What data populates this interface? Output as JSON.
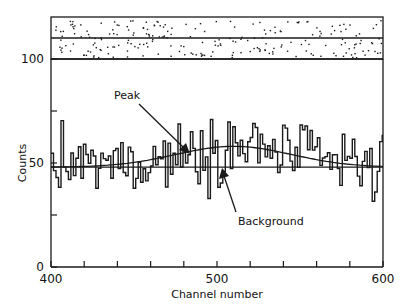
{
  "chart_data": {
    "type": "line",
    "subtype": "histogram-step-with-fitted-curves",
    "title": "",
    "xlabel": "Channel number",
    "ylabel": "Counts",
    "xlim": [
      400,
      600
    ],
    "ylim": [
      0,
      100
    ],
    "x_ticks": [
      400,
      420,
      440,
      460,
      480,
      500,
      520,
      540,
      560,
      580,
      600
    ],
    "x_tick_labels": [
      "400",
      "500",
      "600"
    ],
    "y_ticks": [
      0,
      25,
      50,
      75,
      100
    ],
    "y_tick_labels": [
      "0",
      "50",
      "100"
    ],
    "grid": false,
    "background_level": 48,
    "peak": {
      "center": 510,
      "amplitude": 10,
      "sigma": 35
    },
    "annotations": [
      {
        "text": "Peak",
        "x": 438,
        "y": 82,
        "arrow_to": [
          468,
          57
        ]
      },
      {
        "text": "Background",
        "x": 518,
        "y": 22,
        "arrow_to": [
          508,
          46
        ]
      }
    ],
    "top_panel": {
      "description": "Residual scatter strip above y=100, split by a horizontal center line",
      "rows": 2
    },
    "series": [
      {
        "name": "Counts (histogram)",
        "x": [
          400,
          405,
          410,
          415,
          420,
          425,
          430,
          435,
          440,
          445,
          450,
          455,
          460,
          465,
          470,
          475,
          480,
          485,
          490,
          495,
          500,
          505,
          510,
          515,
          520,
          525,
          530,
          535,
          540,
          545,
          550,
          555,
          560,
          565,
          570,
          575,
          580,
          585,
          590,
          595
        ],
        "values": [
          45,
          52,
          40,
          60,
          38,
          55,
          49,
          42,
          61,
          44,
          53,
          47,
          58,
          43,
          50,
          62,
          46,
          57,
          65,
          55,
          60,
          68,
          52,
          73,
          56,
          60,
          54,
          49,
          52,
          60,
          46,
          55,
          51,
          58,
          44,
          57,
          50,
          53,
          47,
          52
        ]
      },
      {
        "name": "Background",
        "x": [
          400,
          600
        ],
        "values": [
          48,
          48
        ]
      },
      {
        "name": "Peak fit",
        "x": [
          400,
          450,
          480,
          500,
          510,
          520,
          540,
          570,
          600
        ],
        "values": [
          48.1,
          49.6,
          54.5,
          57.6,
          58.0,
          57.6,
          54.5,
          49.6,
          48.1
        ]
      }
    ]
  },
  "axes": {
    "xlabel": "Channel number",
    "ylabel": "Counts",
    "x_tick_labels": [
      {
        "value": 400,
        "text": "400"
      },
      {
        "value": 500,
        "text": "500"
      },
      {
        "value": 600,
        "text": "600"
      }
    ],
    "y_tick_labels": [
      {
        "value": 0,
        "text": "0"
      },
      {
        "value": 50,
        "text": "50"
      },
      {
        "value": 100,
        "text": "100"
      }
    ]
  },
  "annotations": {
    "peak_label": "Peak",
    "background_label": "Background"
  },
  "colors": {
    "ink": "#1a1a1a",
    "paper": "#ffffff"
  }
}
